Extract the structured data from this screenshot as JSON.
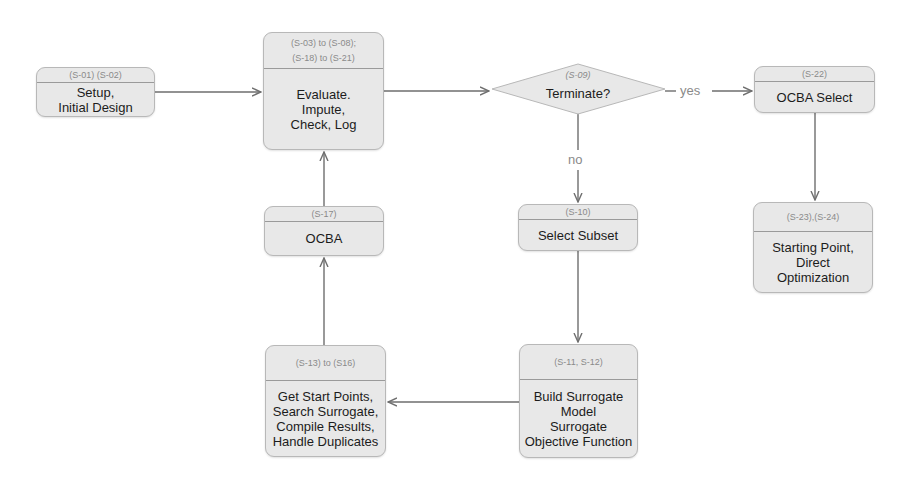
{
  "diagram": {
    "nodes": {
      "setup": {
        "ref": "(S-01) (S-02)",
        "label_lines": [
          "Setup,",
          "Initial Design"
        ]
      },
      "evaluate": {
        "ref_lines": [
          "(S-03) to (S-08);",
          "(S-18) to (S-21)"
        ],
        "label_lines": [
          "Evaluate.",
          "Impute,",
          "Check, Log"
        ]
      },
      "terminate": {
        "ref": "(S-09)",
        "label": "Terminate?"
      },
      "ocba_select": {
        "ref": "(S-22)",
        "label": "OCBA Select"
      },
      "starting_point": {
        "ref": "(S-23),(S-24)",
        "label_lines": [
          "Starting Point,",
          "Direct",
          "Optimization"
        ]
      },
      "select_subset": {
        "ref": "(S-10)",
        "label": "Select Subset"
      },
      "build_surrogate": {
        "ref": "(S-11, S-12)",
        "label_lines": [
          "Build Surrogate",
          "Model",
          "Surrogate",
          "Objective Function"
        ]
      },
      "get_start_points": {
        "ref": "(S-13) to (S16)",
        "label_lines": [
          "Get Start Points,",
          "Search Surrogate,",
          "Compile Results,",
          "Handle Duplicates"
        ]
      },
      "ocba": {
        "ref": "(S-17)",
        "label": "OCBA"
      }
    },
    "edge_labels": {
      "yes": "yes",
      "no": "no"
    },
    "edges": [
      {
        "from": "setup",
        "to": "evaluate"
      },
      {
        "from": "evaluate",
        "to": "terminate"
      },
      {
        "from": "terminate",
        "to": "ocba_select",
        "label": "yes"
      },
      {
        "from": "ocba_select",
        "to": "starting_point"
      },
      {
        "from": "terminate",
        "to": "select_subset",
        "label": "no"
      },
      {
        "from": "select_subset",
        "to": "build_surrogate"
      },
      {
        "from": "build_surrogate",
        "to": "get_start_points"
      },
      {
        "from": "get_start_points",
        "to": "ocba"
      },
      {
        "from": "ocba",
        "to": "evaluate"
      }
    ],
    "colors": {
      "node_fill": "#e8e8e8",
      "node_border": "#b8b8b8",
      "edge": "#6e6e6e",
      "ref_text": "#8a8a8a",
      "label_text": "#1c1c1c"
    }
  }
}
